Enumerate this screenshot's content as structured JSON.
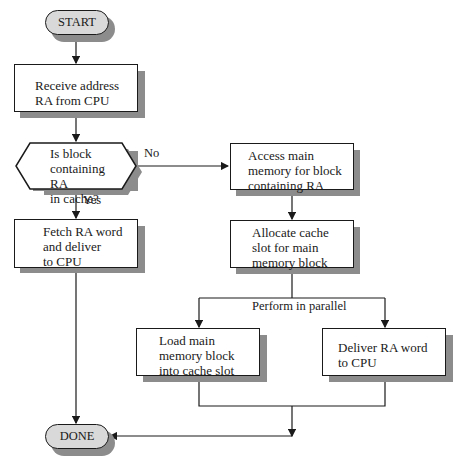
{
  "diagram": {
    "type": "flowchart",
    "title": "",
    "nodes": {
      "start": {
        "label": "START",
        "shape": "terminal"
      },
      "receive": {
        "label": "Receive address\nRA from CPU",
        "shape": "process"
      },
      "decision": {
        "label": "Is block\ncontaining RA\nin cache?",
        "shape": "decision"
      },
      "fetch": {
        "label": "Fetch RA word\nand deliver\nto CPU",
        "shape": "process"
      },
      "access": {
        "label": "Access main\nmemory for block\ncontaining RA",
        "shape": "process"
      },
      "allocate": {
        "label": "Allocate cache\nslot for main\nmemory block",
        "shape": "process"
      },
      "load": {
        "label": "Load main\nmemory block\ninto cache slot",
        "shape": "process"
      },
      "deliver": {
        "label": "Deliver RA word\nto CPU",
        "shape": "process"
      },
      "done": {
        "label": "DONE",
        "shape": "terminal"
      }
    },
    "edge_labels": {
      "no": "No",
      "yes": "Yes",
      "parallel": "Perform in parallel"
    },
    "edges": [
      [
        "start",
        "receive"
      ],
      [
        "receive",
        "decision"
      ],
      [
        "decision",
        "fetch",
        "Yes"
      ],
      [
        "decision",
        "access",
        "No"
      ],
      [
        "access",
        "allocate"
      ],
      [
        "allocate",
        "load",
        "Perform in parallel"
      ],
      [
        "allocate",
        "deliver",
        "Perform in parallel"
      ],
      [
        "load",
        "done"
      ],
      [
        "deliver",
        "done"
      ],
      [
        "fetch",
        "done"
      ]
    ],
    "colors": {
      "terminal_fill": "#d9d9d9",
      "shadow": "#8c8c8c",
      "line": "#1a1a1a"
    }
  }
}
